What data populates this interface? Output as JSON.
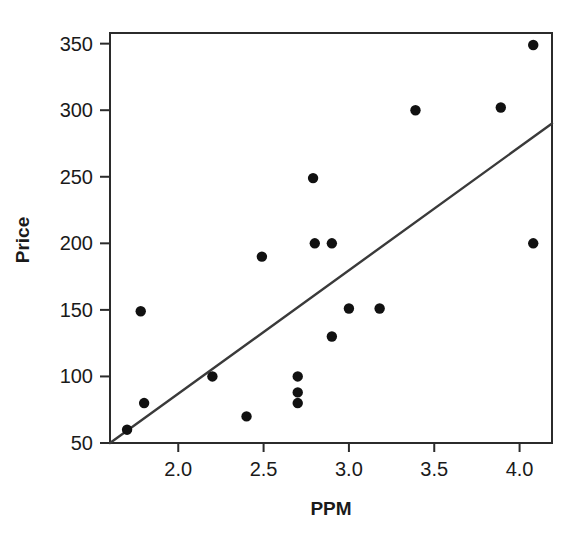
{
  "chart_data": {
    "type": "scatter",
    "title": "",
    "xlabel": "PPM",
    "ylabel": "Price",
    "xlim": [
      1.6,
      4.19
    ],
    "ylim": [
      50,
      358
    ],
    "xticks": [
      2.0,
      2.5,
      3.0,
      3.5,
      4.0
    ],
    "xtick_labels": [
      "2.0",
      "2.5",
      "3.0",
      "3.5",
      "4.0"
    ],
    "yticks": [
      50,
      100,
      150,
      200,
      250,
      300,
      350
    ],
    "ytick_labels": [
      "50",
      "100",
      "150",
      "200",
      "250",
      "300",
      "350"
    ],
    "grid": false,
    "legend": null,
    "points": [
      {
        "x": 1.7,
        "y": 60
      },
      {
        "x": 1.78,
        "y": 149
      },
      {
        "x": 1.8,
        "y": 80
      },
      {
        "x": 2.2,
        "y": 100
      },
      {
        "x": 2.4,
        "y": 70
      },
      {
        "x": 2.49,
        "y": 190
      },
      {
        "x": 2.7,
        "y": 100
      },
      {
        "x": 2.7,
        "y": 88
      },
      {
        "x": 2.7,
        "y": 80
      },
      {
        "x": 2.79,
        "y": 249
      },
      {
        "x": 2.8,
        "y": 200
      },
      {
        "x": 2.9,
        "y": 200
      },
      {
        "x": 2.9,
        "y": 130
      },
      {
        "x": 3.0,
        "y": 151
      },
      {
        "x": 3.18,
        "y": 151
      },
      {
        "x": 3.39,
        "y": 300
      },
      {
        "x": 3.89,
        "y": 302
      },
      {
        "x": 4.08,
        "y": 349
      },
      {
        "x": 4.08,
        "y": 200
      }
    ],
    "fit_line": {
      "name": "regression-line",
      "x0": 1.6,
      "y0": 50,
      "x1": 4.19,
      "y1": 290
    },
    "marker": {
      "shape": "circle",
      "radius_px": 5.2,
      "color": "#111111"
    },
    "colors": {
      "point": "#111111",
      "line": "#3a3a3a",
      "axis": "#2b2b2b",
      "text": "#1a1a1a",
      "background": "#ffffff"
    }
  },
  "layout": {
    "plot_left_px": 110,
    "plot_right_px": 552,
    "plot_top_px": 33,
    "plot_bottom_px": 443
  }
}
